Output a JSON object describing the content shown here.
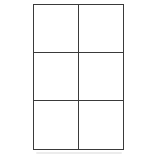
{
  "canvas": {
    "width": 141,
    "height": 157,
    "background": "#ffffff"
  },
  "grid": {
    "type": "blank-table",
    "columns": 2,
    "rows": 3,
    "line_color": "#3a3a3a",
    "cell_fill": "#ffffff",
    "cells": [
      {
        "row": 1,
        "col": 1,
        "content": ""
      },
      {
        "row": 1,
        "col": 2,
        "content": ""
      },
      {
        "row": 2,
        "col": 1,
        "content": ""
      },
      {
        "row": 2,
        "col": 2,
        "content": ""
      },
      {
        "row": 3,
        "col": 1,
        "content": ""
      },
      {
        "row": 3,
        "col": 2,
        "content": ""
      }
    ]
  },
  "artifact": {
    "description": "faint scan smudge below grid",
    "color": "#ececec"
  }
}
